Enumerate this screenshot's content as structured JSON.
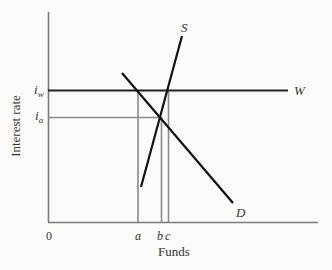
{
  "diagram": {
    "type": "supply-demand",
    "y_axis_label": "Interest rate",
    "x_axis_label": "Funds",
    "origin_label": "0",
    "y_ticks": [
      {
        "label": "i",
        "subscript": "w",
        "name": "i_w"
      },
      {
        "label": "i",
        "subscript": "a",
        "name": "i_a"
      }
    ],
    "x_ticks": [
      {
        "label": "a"
      },
      {
        "label": "b"
      },
      {
        "label": "c"
      }
    ],
    "curves": [
      {
        "label": "S",
        "name": "Supply"
      },
      {
        "label": "D",
        "name": "Demand"
      },
      {
        "label": "W",
        "name": "World interest rate"
      }
    ],
    "colors": {
      "axis": "#7a7a7a",
      "curve": "#111111",
      "guide": "#8a8a8a",
      "text": "#333333"
    }
  }
}
